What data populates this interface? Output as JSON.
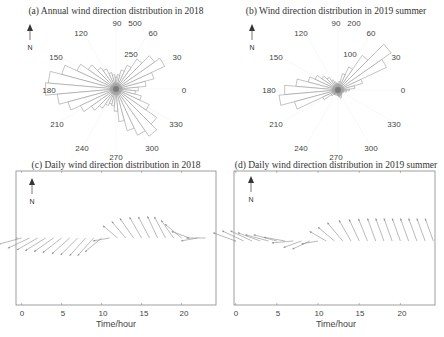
{
  "chart_data": [
    {
      "type": "polar_bar",
      "panel": "a",
      "title": "(a) Annual wind direction distribution in 2018",
      "angle_labels": [
        "0",
        "30",
        "60",
        "90",
        "120",
        "150",
        "180",
        "210",
        "240",
        "270",
        "300",
        "330"
      ],
      "radial_labels": [
        "250",
        "500"
      ],
      "north_arrow": "N",
      "bins_deg": [
        0,
        10,
        20,
        30,
        40,
        50,
        60,
        70,
        80,
        90,
        100,
        110,
        120,
        130,
        140,
        150,
        160,
        170,
        180,
        190,
        200,
        210,
        220,
        230,
        240,
        250,
        260,
        270,
        280,
        290,
        300,
        310,
        320,
        330,
        340,
        350
      ],
      "counts": [
        170,
        230,
        300,
        410,
        360,
        280,
        200,
        150,
        110,
        90,
        110,
        130,
        170,
        200,
        260,
        330,
        430,
        520,
        540,
        450,
        380,
        300,
        230,
        180,
        140,
        120,
        130,
        170,
        250,
        330,
        390,
        440,
        380,
        280,
        200,
        150
      ],
      "rmax": 550
    },
    {
      "type": "polar_bar",
      "panel": "b",
      "title": "(b) Wind direction distribution in 2019 summer",
      "angle_labels": [
        "0",
        "30",
        "60",
        "90",
        "120",
        "150",
        "180",
        "210",
        "240",
        "270",
        "300",
        "330"
      ],
      "radial_labels": [
        "100",
        "200"
      ],
      "north_arrow": "N",
      "bins_deg": [
        0,
        10,
        20,
        30,
        40,
        50,
        60,
        70,
        80,
        90,
        100,
        110,
        120,
        130,
        140,
        150,
        160,
        170,
        180,
        190,
        200,
        210,
        220,
        230,
        240,
        250,
        260,
        270,
        280,
        290,
        300,
        310,
        320,
        330,
        340,
        350
      ],
      "counts": [
        40,
        60,
        90,
        190,
        230,
        150,
        90,
        60,
        30,
        20,
        25,
        30,
        40,
        55,
        70,
        90,
        110,
        150,
        190,
        210,
        160,
        60,
        30,
        20,
        15,
        10,
        15,
        20,
        25,
        30,
        25,
        20,
        15,
        15,
        20,
        30
      ],
      "rmax": 220
    },
    {
      "type": "quiver",
      "panel": "c",
      "title": "(c) Daily wind direction distribution in 2018",
      "xlabel": "Time/hour",
      "ylabel": "",
      "xticks": [
        0,
        5,
        10,
        15,
        20
      ],
      "xlim": [
        -0.7,
        24.3
      ],
      "north_arrow": "N",
      "hours": [
        0,
        1,
        2,
        3,
        4,
        5,
        6,
        7,
        8,
        9,
        10,
        11,
        12,
        13,
        14,
        15,
        16,
        17,
        18,
        19,
        20,
        21,
        22,
        23
      ],
      "direction_deg": [
        195,
        205,
        210,
        212,
        215,
        218,
        222,
        225,
        228,
        228,
        220,
        190,
        140,
        130,
        125,
        120,
        118,
        115,
        118,
        125,
        140,
        160,
        190,
        180
      ],
      "magnitude": [
        1.0,
        1.0,
        1.0,
        1.0,
        1.0,
        1.0,
        1.0,
        1.0,
        1.0,
        1.0,
        0.9,
        0.7,
        0.8,
        0.9,
        1.0,
        1.0,
        1.0,
        1.0,
        1.0,
        0.9,
        0.9,
        0.8,
        0.7,
        0.8
      ]
    },
    {
      "type": "quiver",
      "panel": "d",
      "title": "(d) Daily wind direction distribution in 2019 summer",
      "xlabel": "Time/hour",
      "ylabel": "",
      "xticks": [
        0,
        5,
        10,
        15,
        20
      ],
      "xlim": [
        -0.2,
        24.2
      ],
      "north_arrow": "N",
      "hours": [
        0,
        1,
        2,
        3,
        4,
        5,
        6,
        7,
        8,
        9,
        10,
        11,
        12,
        13,
        14,
        15,
        16,
        17,
        18,
        19,
        20,
        21,
        22,
        23,
        24
      ],
      "direction_deg": [
        160,
        155,
        155,
        160,
        165,
        165,
        170,
        185,
        200,
        205,
        190,
        150,
        140,
        130,
        120,
        115,
        112,
        110,
        110,
        110,
        110,
        110,
        110,
        110,
        110
      ],
      "magnitude": [
        1.0,
        1.0,
        1.0,
        1.0,
        1.0,
        1.0,
        0.9,
        0.9,
        0.8,
        0.8,
        0.7,
        0.8,
        0.9,
        1.0,
        1.0,
        1.0,
        1.0,
        1.0,
        1.0,
        1.0,
        1.0,
        1.0,
        1.0,
        1.0,
        1.0
      ]
    }
  ],
  "panels": {
    "a": {
      "title": "(a) Annual wind direction distribution in 2018",
      "north": "N",
      "labels": {
        "a0": "0",
        "a30": "30",
        "a60": "60",
        "a90": "90",
        "a120": "120",
        "a150": "150",
        "a180": "180",
        "a210": "210",
        "a240": "240",
        "a270": "270",
        "a300": "300",
        "a330": "330",
        "r1": "250",
        "r2": "500"
      }
    },
    "b": {
      "title": "(b) Wind direction distribution in 2019 summer",
      "north": "N",
      "labels": {
        "a0": "0",
        "a30": "30",
        "a60": "60",
        "a90": "90",
        "a120": "120",
        "a150": "150",
        "a180": "180",
        "a210": "210",
        "a240": "240",
        "a270": "270",
        "a300": "300",
        "a330": "330",
        "r1": "100",
        "r2": "200"
      }
    },
    "c": {
      "title": "(c) Daily wind direction distribution in 2018",
      "north": "N",
      "xlabel": "Time/hour",
      "ticks": [
        "0",
        "5",
        "10",
        "15",
        "20"
      ]
    },
    "d": {
      "title": "(d) Daily wind direction distribution in 2019 summer",
      "north": "N",
      "xlabel": "Time/hour",
      "ticks": [
        "0",
        "5",
        "10",
        "15",
        "20"
      ]
    }
  },
  "colors": {
    "bar_edge": "#9a9a9a",
    "axis": "#888888",
    "arrow": "#8c8c8c",
    "text": "#444444"
  }
}
